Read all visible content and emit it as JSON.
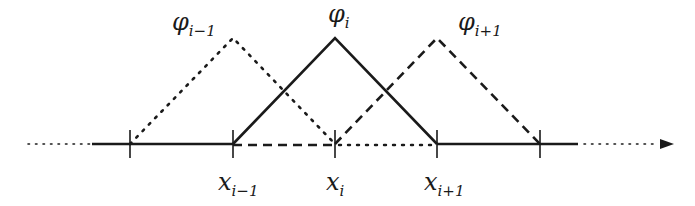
{
  "diagram": {
    "type": "hat basis functions (piecewise linear finite element)",
    "colors": {
      "ink": "#1a1a1a",
      "background": "#ffffff"
    },
    "axis": {
      "y": 144,
      "solid_left_start": 92,
      "solid_right_end": 578,
      "dotted_left": [
        28,
        90
      ],
      "dotted_right": [
        584,
        658
      ],
      "arrow_tip": 674
    },
    "ticks_x": [
      130,
      233,
      335,
      437,
      540
    ],
    "peak_y": 38,
    "functions": [
      {
        "name": "phi_{i-1}",
        "style": "dotted",
        "left": 130,
        "peak": 233,
        "right": 335,
        "label": {
          "base": "φ",
          "sub": "i−1",
          "x": 172,
          "y": 30
        }
      },
      {
        "name": "phi_i",
        "style": "solid",
        "left": 233,
        "peak": 335,
        "right": 437,
        "label": {
          "base": "φ",
          "sub": "i",
          "x": 328,
          "y": 22
        }
      },
      {
        "name": "phi_{i+1}",
        "style": "dashed",
        "left": 335,
        "peak": 437,
        "right": 540,
        "label": {
          "base": "φ",
          "sub": "i+1",
          "x": 458,
          "y": 30
        }
      }
    ],
    "node_labels": [
      {
        "base": "x",
        "sub": "i−1",
        "x": 218,
        "y": 190
      },
      {
        "base": "x",
        "sub": "i",
        "x": 326,
        "y": 190
      },
      {
        "base": "x",
        "sub": "i+1",
        "x": 424,
        "y": 190
      }
    ]
  }
}
